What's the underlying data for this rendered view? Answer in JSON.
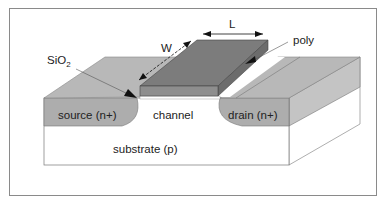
{
  "diagram": {
    "labels": {
      "length": "L",
      "width": "W",
      "poly": "poly",
      "oxide_main": "SiO",
      "oxide_sub": "2",
      "source": "source (n+)",
      "channel": "channel",
      "drain": "drain (n+)",
      "substrate": "substrate (p)"
    },
    "colors": {
      "frame": "#8a8a8a",
      "oxide_top": "#b8b8b8",
      "oxide_side": "#c8c8c8",
      "poly_top": "#7c7c7c",
      "poly_front": "#8e8e8e",
      "poly_side": "#6c6c6c",
      "doped_region": "#adadad",
      "substrate": "#ffffff",
      "outline": "#555555",
      "arrow": "#111111"
    }
  }
}
